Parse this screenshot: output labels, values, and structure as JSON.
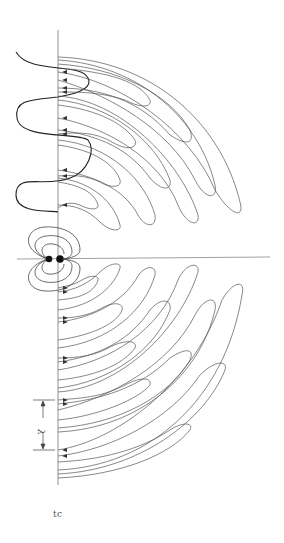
{
  "figure": {
    "wavelength_label": "λ",
    "caption": "tc",
    "colors": {
      "line": "#555555",
      "axis": "#777777",
      "wave": "#222222",
      "charge": "#111111"
    }
  }
}
